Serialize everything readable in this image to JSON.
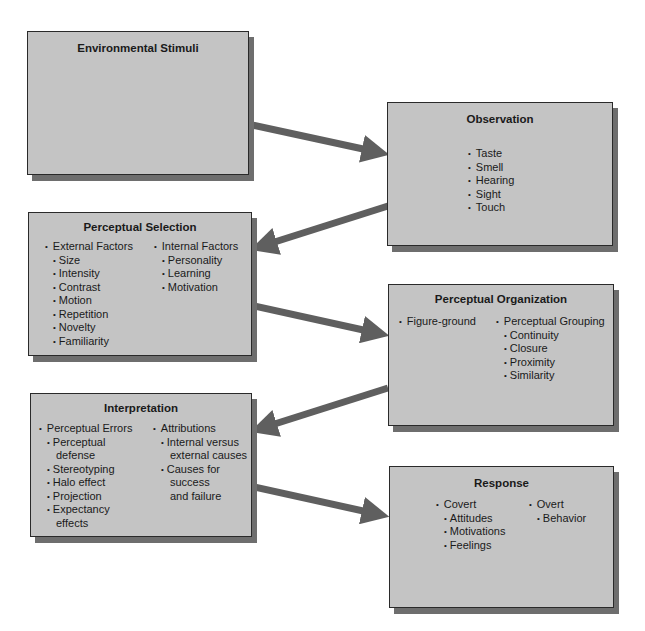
{
  "diagram": {
    "colors": {
      "box_fill": "#c4c4c4",
      "box_border": "#2a2a2a",
      "shadow": "#6e6e6e",
      "arrow": "#5f5f5f"
    },
    "nodes": {
      "environmental_stimuli": {
        "title": "Environmental Stimuli"
      },
      "observation": {
        "title": "Observation",
        "items": [
          "Taste",
          "Smell",
          "Hearing",
          "Sight",
          "Touch"
        ]
      },
      "perceptual_selection": {
        "title": "Perceptual Selection",
        "external": {
          "label": "External Factors",
          "items": [
            "Size",
            "Intensity",
            "Contrast",
            "Motion",
            "Repetition",
            "Novelty",
            "Familiarity"
          ]
        },
        "internal": {
          "label": "Internal Factors",
          "items": [
            "Personality",
            "Learning",
            "Motivation"
          ]
        }
      },
      "perceptual_organization": {
        "title": "Perceptual Organization",
        "figure_ground": {
          "label": "Figure-ground"
        },
        "grouping": {
          "label": "Perceptual Grouping",
          "items": [
            "Continuity",
            "Closure",
            "Proximity",
            "Similarity"
          ]
        }
      },
      "interpretation": {
        "title": "Interpretation",
        "errors": {
          "label": "Perceptual Errors",
          "items": [
            "Perceptual",
            "defense",
            "Stereotyping",
            "Halo effect",
            "Projection",
            "Expectancy",
            "effects"
          ]
        },
        "attributions": {
          "label": "Attributions",
          "items": [
            "Internal versus",
            "external causes",
            "Causes for",
            "success",
            "and failure"
          ]
        }
      },
      "response": {
        "title": "Response",
        "covert": {
          "label": "Covert",
          "items": [
            "Attitudes",
            "Motivations",
            "Feelings"
          ]
        },
        "overt": {
          "label": "Overt",
          "items": [
            "Behavior"
          ]
        }
      }
    },
    "edges": [
      {
        "from": "environmental_stimuli",
        "to": "observation"
      },
      {
        "from": "observation",
        "to": "perceptual_selection"
      },
      {
        "from": "perceptual_selection",
        "to": "perceptual_organization"
      },
      {
        "from": "perceptual_organization",
        "to": "interpretation"
      },
      {
        "from": "interpretation",
        "to": "response"
      }
    ]
  }
}
